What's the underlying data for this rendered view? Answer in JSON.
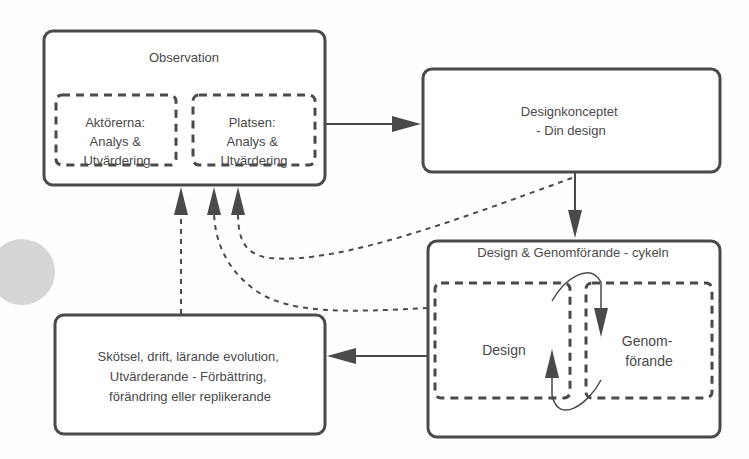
{
  "colors": {
    "stroke": "#4a4a4a",
    "text": "#4a4a4a",
    "decor_circle": "#d6d6d6",
    "background": "#fefefe"
  },
  "nodes": {
    "observation": {
      "title": "Observation",
      "sub_actors": [
        "Aktörerna:",
        "Analys &",
        "Utvärdering"
      ],
      "sub_place": [
        "Platsen:",
        "Analys &",
        "Utvärdering"
      ]
    },
    "concept": {
      "lines": [
        "Designkonceptet",
        "- Din design"
      ]
    },
    "cycle": {
      "title": "Design & Genomförande - cykeln",
      "design_label": "Design",
      "implementation_label": [
        "Genom-",
        "förande"
      ]
    },
    "maintenance": {
      "lines": [
        "Skötsel, drift, lärande evolution,",
        "Utvärderande - Förbättring,",
        "förändring eller replikerande"
      ]
    }
  },
  "edges": [
    {
      "from": "observation",
      "to": "concept",
      "style": "solid"
    },
    {
      "from": "concept",
      "to": "cycle",
      "style": "solid"
    },
    {
      "from": "cycle",
      "to": "maintenance",
      "style": "solid"
    },
    {
      "from": "maintenance",
      "to": "observation",
      "style": "dashed"
    },
    {
      "from": "cycle",
      "to": "observation",
      "style": "dashed"
    },
    {
      "from": "concept",
      "to": "observation",
      "style": "dashed"
    },
    {
      "from": "design",
      "to": "implementation",
      "style": "cycle-loop"
    }
  ]
}
